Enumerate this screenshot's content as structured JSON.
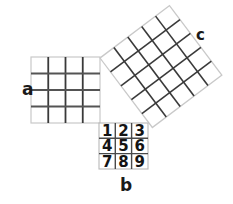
{
  "figure": {
    "type": "pythagorean-theorem-diagram",
    "background_color": "#ffffff",
    "ink_color": "#333333",
    "faint_color": "#c9c9c9",
    "squares": [
      {
        "id": "a",
        "label": "a",
        "label_position": "left",
        "grid": "4x4",
        "rows": 4,
        "cols": 4,
        "cell_count": 16,
        "rotation_deg": 0,
        "side_px": 69
      },
      {
        "id": "b",
        "label": "b",
        "label_position": "bottom",
        "grid": "3x3",
        "rows": 3,
        "cols": 3,
        "cell_count": 9,
        "rotation_deg": 0,
        "side_px": 49,
        "cell_labels": [
          [
            "1",
            "2",
            "3"
          ],
          [
            "4",
            "5",
            "6"
          ],
          [
            "7",
            "8",
            "9"
          ]
        ]
      },
      {
        "id": "c",
        "label": "c",
        "label_position": "top-right",
        "grid": "5x5",
        "rows": 5,
        "cols": 5,
        "cell_count": 25,
        "rotation_deg": -37,
        "side_px": 87
      }
    ],
    "labels": {
      "a": "a",
      "b": "b",
      "c": "c"
    }
  }
}
